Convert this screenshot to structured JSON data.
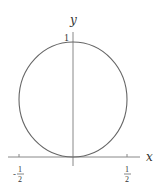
{
  "diagram": {
    "y_axis_label": "y",
    "x_axis_label": "x",
    "y_tick_label": "1",
    "x_ticks": [
      {
        "label_num": "1",
        "label_den": "2",
        "sign": "-"
      },
      {
        "label_num": "1",
        "label_den": "2",
        "sign": ""
      }
    ],
    "curve": {
      "type": "circle",
      "center": [
        0,
        0.5
      ],
      "radius": 0.5
    },
    "caption_partial": "Figure 1 ... (cut off)"
  },
  "colors": {
    "axis": "#777777",
    "curve": "#666666"
  }
}
